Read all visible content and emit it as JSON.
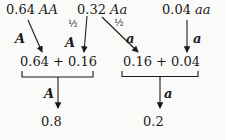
{
  "genotype_row": [
    {
      "value": "0.64",
      "genotype": "AA"
    },
    {
      "value": "0.32",
      "genotype": "Aa"
    },
    {
      "value": "0.04",
      "genotype": "aa"
    }
  ],
  "transfer_labels": {
    "AA_allele": "A",
    "Aa_half_left": "½",
    "Aa_left_allele": "A",
    "Aa_half_right": "½",
    "Aa_right_allele": "a",
    "aa_allele": "a"
  },
  "sum_row": {
    "A_sum": "0.64 + 0.16",
    "a_sum": "0.16 + 0.04"
  },
  "total_labels": {
    "A": "A",
    "a": "a"
  },
  "result_row": {
    "A_frequency": "0.8",
    "a_frequency": "0.2"
  }
}
